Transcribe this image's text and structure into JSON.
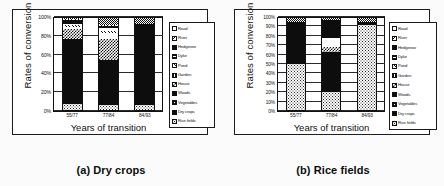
{
  "figure": {
    "panels": [
      {
        "id": "panel-a",
        "caption": "(a) Dry crops",
        "chart_data": {
          "type": "bar",
          "subtype": "stacked-percentage",
          "title": "",
          "xlabel": "Years of transition",
          "ylabel": "Rates of conversion",
          "categories": [
            "55/77",
            "77/84",
            "84/93"
          ],
          "ylim": [
            0,
            100
          ],
          "yticks": [
            "0%",
            "20%",
            "40%",
            "60%",
            "80%",
            "100%"
          ],
          "grid": true,
          "legend_position": "right",
          "series": [
            {
              "name": "Rice fields",
              "pattern": "dots-light",
              "values": [
                6,
                5,
                5
              ]
            },
            {
              "name": "Dry crops",
              "pattern": "black",
              "values": [
                71,
                49,
                88
              ]
            },
            {
              "name": "Vegetables",
              "pattern": "solid-grey",
              "values": [
                0,
                0,
                0
              ]
            },
            {
              "name": "Woods",
              "pattern": "black",
              "values": [
                0,
                0,
                0
              ]
            },
            {
              "name": "House",
              "pattern": "checker",
              "values": [
                11,
                23,
                0
              ]
            },
            {
              "name": "Garden",
              "pattern": "white",
              "values": [
                2,
                7,
                0
              ]
            },
            {
              "name": "Pond",
              "pattern": "hatch",
              "values": [
                2,
                2,
                0
              ]
            },
            {
              "name": "Dyke",
              "pattern": "white",
              "values": [
                2,
                3,
                0
              ]
            },
            {
              "name": "Hedgerow",
              "pattern": "black",
              "values": [
                4,
                2,
                0
              ]
            },
            {
              "name": "River",
              "pattern": "hatch-back",
              "values": [
                1,
                1,
                0
              ]
            },
            {
              "name": "Road",
              "pattern": "checker-fine",
              "values": [
                1,
                8,
                7
              ]
            }
          ]
        }
      },
      {
        "id": "panel-b",
        "caption": "(b) Rice fields",
        "chart_data": {
          "type": "bar",
          "subtype": "stacked-percentage",
          "title": "",
          "xlabel": "Years of transition",
          "ylabel": "Rates of conversion",
          "categories": [
            "55/77",
            "77/84",
            "84/93"
          ],
          "ylim": [
            0,
            100
          ],
          "yticks": [
            "0%",
            "10%",
            "20%",
            "30%",
            "40%",
            "50%",
            "60%",
            "70%",
            "80%",
            "90%",
            "100%"
          ],
          "grid": true,
          "legend_position": "right",
          "series": [
            {
              "name": "Rice fields",
              "pattern": "dots-light",
              "values": [
                50,
                20,
                92
              ]
            },
            {
              "name": "Dry crops",
              "pattern": "black",
              "values": [
                46,
                43,
                0
              ]
            },
            {
              "name": "Vegetables",
              "pattern": "solid-grey",
              "values": [
                0,
                0,
                0
              ]
            },
            {
              "name": "Woods",
              "pattern": "black",
              "values": [
                0,
                0,
                0
              ]
            },
            {
              "name": "House",
              "pattern": "checker",
              "values": [
                0,
                5,
                0
              ]
            },
            {
              "name": "Garden",
              "pattern": "white",
              "values": [
                0,
                10,
                0
              ]
            },
            {
              "name": "Pond",
              "pattern": "hatch",
              "values": [
                0,
                0,
                0
              ]
            },
            {
              "name": "Dyke",
              "pattern": "white",
              "values": [
                0,
                0,
                0
              ]
            },
            {
              "name": "Hedgerow",
              "pattern": "black",
              "values": [
                0,
                20,
                4
              ]
            },
            {
              "name": "River",
              "pattern": "hatch-back",
              "values": [
                0,
                0,
                0
              ]
            },
            {
              "name": "Road",
              "pattern": "checker-fine",
              "values": [
                4,
                2,
                4
              ]
            }
          ]
        }
      }
    ],
    "legend_entries": [
      {
        "label": "Road",
        "pattern": "white"
      },
      {
        "label": "River",
        "pattern": "hatch-back"
      },
      {
        "label": "Hedgerow",
        "pattern": "black"
      },
      {
        "label": "Dyke",
        "pattern": "hlines"
      },
      {
        "label": "Pond",
        "pattern": "hatch"
      },
      {
        "label": "Garden",
        "pattern": "vlines"
      },
      {
        "label": "House",
        "pattern": "checker"
      },
      {
        "label": "Woods",
        "pattern": "black"
      },
      {
        "label": "Vegetables",
        "pattern": "grid"
      },
      {
        "label": "Dry crops",
        "pattern": "black"
      },
      {
        "label": "Rice fields",
        "pattern": "dots-light"
      }
    ]
  }
}
